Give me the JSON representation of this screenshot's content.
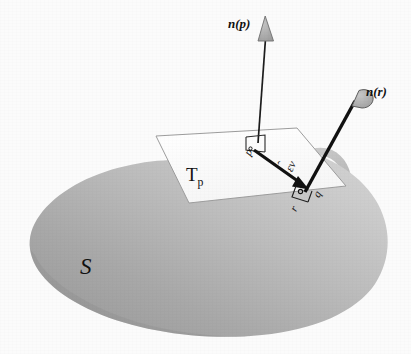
{
  "figure": {
    "background_color": "#fbfbfb",
    "labels": {
      "normal_at_p": "n(p)",
      "normal_at_r": "n(r)",
      "tangent_plane": "T",
      "tangent_plane_sub": "p",
      "surface": "S",
      "point_p": "p",
      "point_q": "q",
      "point_r": "r",
      "displacement": "εv"
    },
    "colors": {
      "surface_front_light": "#c9c9c9",
      "surface_front_dark": "#8e8e8e",
      "surface_back": "#c2c2c2",
      "plane_fill": "#fdfdfd",
      "plane_stroke": "#9a9a9a",
      "arrow_dark": "#1a1a1a",
      "arrowhead_gray": "#a8a8a8",
      "text": "#111111"
    },
    "elements": [
      {
        "name": "surface-blob",
        "kind": "shape",
        "description": "shaded curved surface S"
      },
      {
        "name": "tangent-plane",
        "kind": "shape",
        "description": "white parallelogram tangent plane at p"
      },
      {
        "name": "normal-vector-p",
        "kind": "arrow",
        "from": "p",
        "label": "n(p)"
      },
      {
        "name": "normal-vector-r",
        "kind": "arrow",
        "from": "r",
        "label": "n(r)"
      },
      {
        "name": "displacement-vector",
        "kind": "arrow",
        "from": "p",
        "to": "q",
        "label": "εv"
      },
      {
        "name": "right-angle-marker-p",
        "kind": "marker"
      },
      {
        "name": "right-angle-marker-r",
        "kind": "marker"
      }
    ]
  }
}
